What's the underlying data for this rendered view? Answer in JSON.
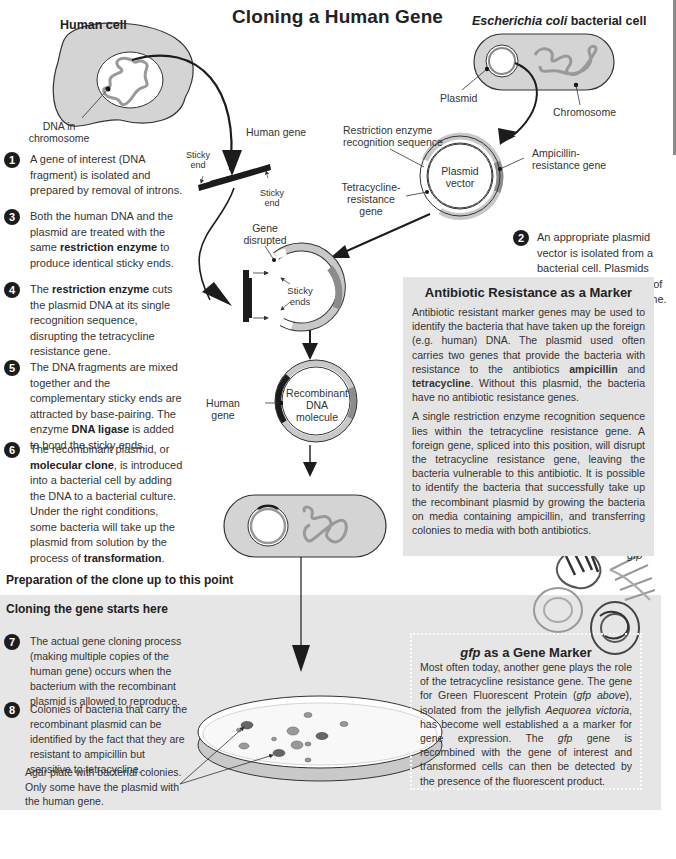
{
  "title": "Cloning a Human Gene",
  "labels": {
    "human_cell": "Human cell",
    "ecoli_italic": "Escherichia coli",
    "ecoli_rest": " bacterial cell",
    "dna_in_chromosome_1": "DNA in",
    "dna_in_chromosome_2": "chromosome",
    "human_gene": "Human gene",
    "sticky_end": "Sticky",
    "sticky_end_2": "end",
    "plasmid": "Plasmid",
    "chromosome": "Chromosome",
    "restriction_seq_1": "Restriction enzyme",
    "restriction_seq_2": "recognition sequence",
    "ampicillin_1": "Ampicillin-",
    "ampicillin_2": "resistance gene",
    "tetracycline_1": "Tetracycline-",
    "tetracycline_2": "resistance gene",
    "plasmid_vector_1": "Plasmid",
    "plasmid_vector_2": "vector",
    "gene_disrupted_1": "Gene",
    "gene_disrupted_2": "disrupted",
    "sticky_ends_1": "Sticky",
    "sticky_ends_2": "ends",
    "recombinant_1": "Recombinant",
    "recombinant_2": "DNA",
    "recombinant_3": "molecule",
    "human_gene2_1": "Human",
    "human_gene2_2": "gene",
    "gfp": "gfp"
  },
  "steps": [
    {
      "num": "1",
      "parts": [
        {
          "t": "A gene of interest (DNA fragment) is isolated and prepared by removal of introns."
        }
      ]
    },
    {
      "num": "2",
      "parts": [
        {
          "t": "An appropriate plasmid vector is isolated from a bacterial cell. Plasmids replicate independently of the bacterial chromosome."
        }
      ]
    },
    {
      "num": "3",
      "parts": [
        {
          "t": "Both the human DNA and the plasmid are treated with the same "
        },
        {
          "b": "restriction enzyme"
        },
        {
          "t": " to produce identical sticky ends."
        }
      ]
    },
    {
      "num": "4",
      "parts": [
        {
          "t": "The "
        },
        {
          "b": "restriction enzyme"
        },
        {
          "t": " cuts the plasmid DNA at its single recognition sequence, disrupting the tetracycline resistance gene."
        }
      ]
    },
    {
      "num": "5",
      "parts": [
        {
          "t": "The DNA fragments are mixed together and the complementary sticky ends are attracted by base-pairing. The enzyme "
        },
        {
          "b": "DNA ligase"
        },
        {
          "t": " is added to bond the sticky ends."
        }
      ]
    },
    {
      "num": "6",
      "parts": [
        {
          "t": "The recombinant plasmid, or "
        },
        {
          "b": "molecular clone"
        },
        {
          "t": ", is introduced into a bacterial cell by adding the DNA to a bacterial culture. Under the right conditions, some bacteria will take up the plasmid from solution by the process of "
        },
        {
          "b": "transformation"
        },
        {
          "t": "."
        }
      ]
    },
    {
      "num": "7",
      "parts": [
        {
          "t": "The actual gene cloning process (making multiple copies of the human gene) occurs when the bacterium with the recombinant plasmid is allowed to reproduce."
        }
      ]
    },
    {
      "num": "8",
      "parts": [
        {
          "t": "Colonies of bacteria that carry the recombinant plasmid can be identified by the fact that they are resistant to ampicillin but sensitive to tetracycline."
        }
      ]
    }
  ],
  "section_headings": {
    "preparation": "Preparation of the clone up to this point",
    "cloning": "Cloning the gene starts here"
  },
  "agar_caption": "Agar plate with bacterial colonies. Only some have the plasmid with the human gene.",
  "antibiotic_box": {
    "title": "Antibiotic Resistance as a Marker",
    "p1": [
      {
        "t": "Antibiotic resistant marker genes may be used to identify the bacteria that have taken up the foreign (e.g. human) DNA. The plasmid used often carries two genes that provide the bacteria with resistance to the antibiotics "
      },
      {
        "b": "ampicillin"
      },
      {
        "t": " and "
      },
      {
        "b": "tetracycline"
      },
      {
        "t": ". Without this plasmid, the bacteria have no antibiotic resistance genes."
      }
    ],
    "p2": [
      {
        "t": "A single restriction enzyme recognition sequence lies within the tetracycline resistance gene. A foreign gene, spliced into this position, will disrupt the tetracycline resistance gene, leaving the bacteria vulnerable to this antibiotic. It is possible to identify the bacteria that successfully take up the recombinant plasmid by growing the bacteria on media containing ampicillin, and transferring colonies to media with both antibiotics."
      }
    ]
  },
  "gfp_box": {
    "title_italic": "gfp",
    "title_rest": " as a Gene Marker",
    "p": [
      {
        "t": "Most often today, another gene plays the role of the tetracycline resistance gene. The gene for Green Fluorescent Protein ("
      },
      {
        "i": "gfp above"
      },
      {
        "t": "), isolated from the jellyfish "
      },
      {
        "i": "Aequorea victoria"
      },
      {
        "t": ", has become well established a a marker for gene expression. The "
      },
      {
        "i": "gfp"
      },
      {
        "t": " gene is recombined with the gene of interest and transformed cells can then be detected by the presence of the fluorescent product."
      }
    ]
  },
  "colors": {
    "cell_fill": "#d4d4d4",
    "plasmid_light": "#c8c8c8",
    "plasmid_dark": "#8c8c8c",
    "chromosome": "#9a9a9a",
    "band_bg": "#e6e6e6",
    "box_bg": "#e4e4e4",
    "ink": "#1c1c1c"
  }
}
